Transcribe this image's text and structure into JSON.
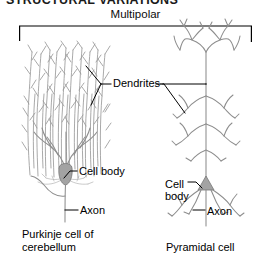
{
  "figure": {
    "section_heading": "STRUCTURAL VARIATIONS",
    "category_label": "Multipolar",
    "background_color": "#ffffff",
    "ink_color": "#8d8d8d",
    "soma_color": "#a3a3a3",
    "leader_color": "#000000"
  },
  "labels": {
    "dendrites": "Dendrites",
    "cell_body_left": "Cell body",
    "axon_left": "Axon",
    "cell_body_right_line1": "Cell",
    "cell_body_right_line2": "body",
    "axon_right": "Axon"
  },
  "captions": {
    "left_line1": "Purkinje cell of",
    "left_line2": "cerebellum",
    "right_line1": "Pyramidal cell"
  },
  "cells": [
    {
      "name": "Purkinje cell of cerebellum",
      "class": "Multipolar",
      "parts": [
        "Dendrites",
        "Cell body",
        "Axon"
      ],
      "dendrite_pattern": "dense planar fan"
    },
    {
      "name": "Pyramidal cell",
      "class": "Multipolar",
      "parts": [
        "Dendrites",
        "Cell body",
        "Axon"
      ],
      "dendrite_pattern": "apical and basal branching"
    }
  ]
}
